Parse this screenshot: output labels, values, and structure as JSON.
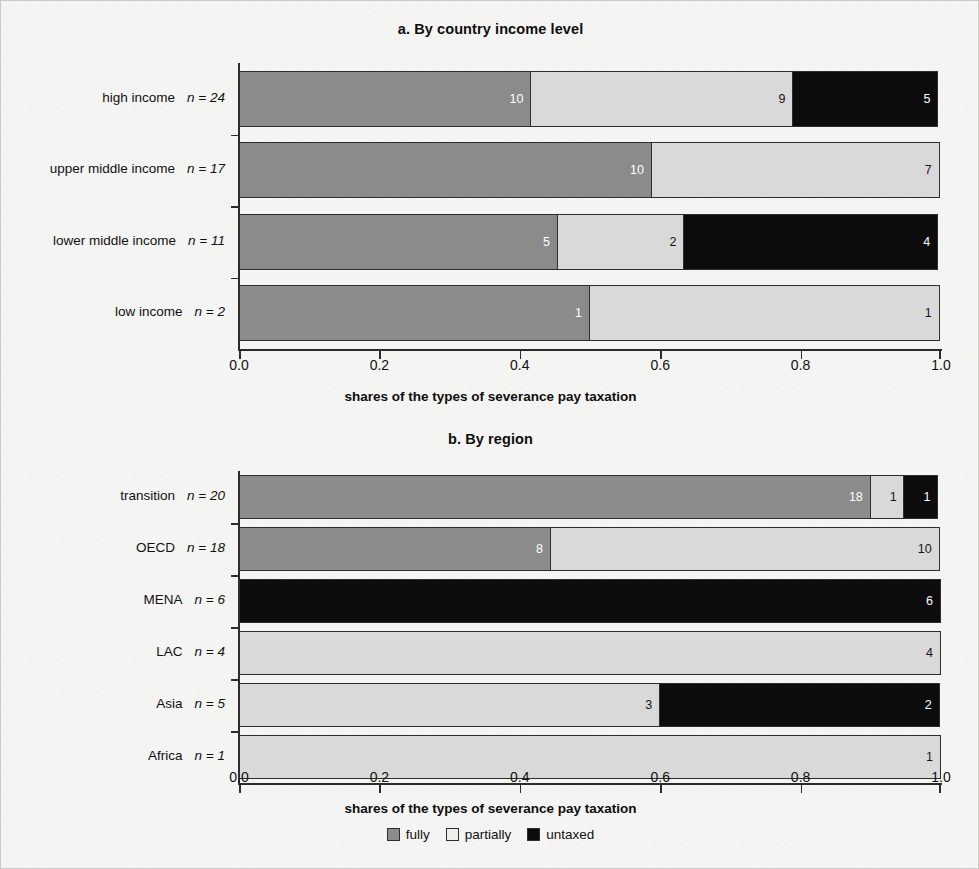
{
  "legend": {
    "position": "bottom-center",
    "items": [
      {
        "key": "fully",
        "label": "fully",
        "color": "#8b8b8b"
      },
      {
        "key": "partially",
        "label": "partially",
        "color": "#ededed"
      },
      {
        "key": "untaxed",
        "label": "untaxed",
        "color": "#0c0c0c"
      }
    ]
  },
  "xaxis": {
    "title": "shares of the types of severance pay taxation",
    "ticks": [
      "0.0",
      "0.2",
      "0.4",
      "0.6",
      "0.8",
      "1.0"
    ],
    "min": 0,
    "max": 1
  },
  "panel_a": {
    "title": "a. By country income level"
  },
  "panel_b": {
    "title": "b. By region"
  },
  "chart_data": [
    {
      "type": "bar",
      "orientation": "horizontal",
      "stacked": true,
      "normalized": true,
      "panel": "a",
      "title": "a. By country income level",
      "xlabel": "shares of the types of severance pay taxation",
      "ylabel": "",
      "xlim": [
        0,
        1
      ],
      "xticks": [
        0.0,
        0.2,
        0.4,
        0.6,
        0.8,
        1.0
      ],
      "grid": false,
      "legend": [
        "fully",
        "partially",
        "untaxed"
      ],
      "categories": [
        "high income",
        "upper middle income",
        "lower middle income",
        "low income"
      ],
      "n_totals": [
        24,
        17,
        11,
        2
      ],
      "n_prefix": "n",
      "n_separator": "=",
      "series": [
        {
          "name": "fully",
          "color": "#8b8b8b",
          "values": [
            10,
            10,
            5,
            1
          ]
        },
        {
          "name": "partially",
          "color": "#d9d9d9",
          "values": [
            9,
            7,
            2,
            1
          ]
        },
        {
          "name": "untaxed",
          "color": "#0c0c0c",
          "values": [
            5,
            0,
            4,
            0
          ]
        }
      ],
      "rows": [
        {
          "category": "high income",
          "n_label": "n = 24",
          "total": 24,
          "segments": [
            {
              "type": "fully",
              "count": 10,
              "label": "10",
              "share": 0.4167
            },
            {
              "type": "partially",
              "count": 9,
              "label": "9",
              "share": 0.375
            },
            {
              "type": "untaxed",
              "count": 5,
              "label": "5",
              "share": 0.2083
            }
          ]
        },
        {
          "category": "upper middle income",
          "n_label": "n = 17",
          "total": 17,
          "segments": [
            {
              "type": "fully",
              "count": 10,
              "label": "10",
              "share": 0.5882
            },
            {
              "type": "partially",
              "count": 7,
              "label": "7",
              "share": 0.4118
            }
          ]
        },
        {
          "category": "lower middle income",
          "n_label": "n = 11",
          "total": 11,
          "segments": [
            {
              "type": "fully",
              "count": 5,
              "label": "5",
              "share": 0.4545
            },
            {
              "type": "partially",
              "count": 2,
              "label": "2",
              "share": 0.1818
            },
            {
              "type": "untaxed",
              "count": 4,
              "label": "4",
              "share": 0.3636
            }
          ]
        },
        {
          "category": "low income",
          "n_label": "n = 2",
          "total": 2,
          "segments": [
            {
              "type": "fully",
              "count": 1,
              "label": "1",
              "share": 0.5
            },
            {
              "type": "partially",
              "count": 1,
              "label": "1",
              "share": 0.5
            }
          ]
        }
      ]
    },
    {
      "type": "bar",
      "orientation": "horizontal",
      "stacked": true,
      "normalized": true,
      "panel": "b",
      "title": "b. By region",
      "xlabel": "shares of the types of severance pay taxation",
      "ylabel": "",
      "xlim": [
        0,
        1
      ],
      "xticks": [
        0.0,
        0.2,
        0.4,
        0.6,
        0.8,
        1.0
      ],
      "grid": false,
      "legend": [
        "fully",
        "partially",
        "untaxed"
      ],
      "categories": [
        "transition",
        "OECD",
        "MENA",
        "LAC",
        "Asia",
        "Africa"
      ],
      "n_totals": [
        20,
        18,
        6,
        4,
        5,
        1
      ],
      "n_prefix": "n",
      "n_separator": "=",
      "series": [
        {
          "name": "fully",
          "color": "#8b8b8b",
          "values": [
            18,
            8,
            0,
            0,
            0,
            0
          ]
        },
        {
          "name": "partially",
          "color": "#d9d9d9",
          "values": [
            1,
            10,
            0,
            4,
            3,
            1
          ]
        },
        {
          "name": "untaxed",
          "color": "#0c0c0c",
          "values": [
            1,
            0,
            6,
            0,
            2,
            0
          ]
        }
      ],
      "rows": [
        {
          "category": "transition",
          "n_label": "n = 20",
          "total": 20,
          "segments": [
            {
              "type": "fully",
              "count": 18,
              "label": "18",
              "share": 0.9
            },
            {
              "type": "partially",
              "count": 1,
              "label": "1",
              "share": 0.05
            },
            {
              "type": "untaxed",
              "count": 1,
              "label": "1",
              "share": 0.05
            }
          ]
        },
        {
          "category": "OECD",
          "n_label": "n = 18",
          "total": 18,
          "segments": [
            {
              "type": "fully",
              "count": 8,
              "label": "8",
              "share": 0.4444
            },
            {
              "type": "partially",
              "count": 10,
              "label": "10",
              "share": 0.5556
            }
          ]
        },
        {
          "category": "MENA",
          "n_label": "n = 6",
          "total": 6,
          "segments": [
            {
              "type": "untaxed",
              "count": 6,
              "label": "6",
              "share": 1.0
            }
          ]
        },
        {
          "category": "LAC",
          "n_label": "n = 4",
          "total": 4,
          "segments": [
            {
              "type": "partially",
              "count": 4,
              "label": "4",
              "share": 1.0
            }
          ]
        },
        {
          "category": "Asia",
          "n_label": "n = 5",
          "total": 5,
          "segments": [
            {
              "type": "partially",
              "count": 3,
              "label": "3",
              "share": 0.6
            },
            {
              "type": "untaxed",
              "count": 2,
              "label": "2",
              "share": 0.4
            }
          ]
        },
        {
          "category": "Africa",
          "n_label": "n = 1",
          "total": 1,
          "segments": [
            {
              "type": "partially",
              "count": 1,
              "label": "1",
              "share": 1.0
            }
          ]
        }
      ]
    }
  ]
}
